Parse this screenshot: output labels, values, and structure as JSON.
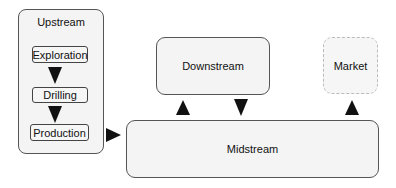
{
  "diagram": {
    "nodes": {
      "upstream": {
        "label": "Upstream",
        "steps": [
          {
            "label": "Exploration"
          },
          {
            "label": "Drilling"
          },
          {
            "label": "Production"
          }
        ]
      },
      "downstream": {
        "label": "Downstream"
      },
      "market": {
        "label": "Market"
      },
      "midstream": {
        "label": "Midstream"
      }
    },
    "edges": [
      {
        "from": "Exploration",
        "to": "Drilling",
        "direction": "down"
      },
      {
        "from": "Drilling",
        "to": "Production",
        "direction": "down"
      },
      {
        "from": "Upstream",
        "to": "Midstream",
        "direction": "right"
      },
      {
        "from": "Midstream",
        "to": "Downstream",
        "direction": "up"
      },
      {
        "from": "Downstream",
        "to": "Midstream",
        "direction": "down"
      },
      {
        "from": "Midstream",
        "to": "Market",
        "direction": "up"
      }
    ],
    "colors": {
      "box_fill": "#f4f4f4",
      "box_border": "#555555",
      "arrow": "#111111",
      "market_border": "#bbbbbb"
    }
  }
}
